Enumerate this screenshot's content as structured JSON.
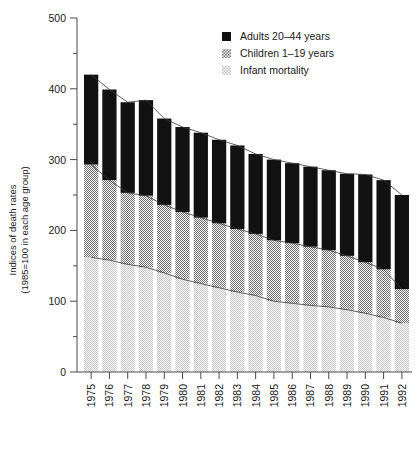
{
  "chart_data": {
    "type": "bar",
    "title": "",
    "subtitle": "",
    "stacked": true,
    "xlabel": "",
    "ylabel": "Indices of death rates",
    "ylabel_line2": "(1985=100 in each age group)",
    "ylim": [
      0,
      500
    ],
    "yticks": [
      0,
      100,
      200,
      300,
      400,
      500
    ],
    "ytick_labels": [
      "0",
      "100",
      "200",
      "300",
      "400",
      "500"
    ],
    "yminor_step": 50,
    "grid": false,
    "legend_position": "top-right",
    "categories": [
      "1975",
      "1976",
      "1977",
      "1978",
      "1979",
      "1980",
      "1981",
      "1982",
      "1983",
      "1984",
      "1985",
      "1986",
      "1987",
      "1988",
      "1989",
      "1990",
      "1991",
      "1992"
    ],
    "series": [
      {
        "name": "Infant mortality",
        "key": "infant",
        "fill": "#d0d0d0",
        "pattern": "fine-checker-light",
        "values": [
          162,
          158,
          152,
          148,
          140,
          131,
          125,
          119,
          113,
          108,
          100,
          97,
          94,
          92,
          88,
          83,
          77,
          69
        ]
      },
      {
        "name": "Children 1–19 years",
        "key": "children",
        "fill": "#8c8c8c",
        "pattern": "checker-mid",
        "values": [
          131,
          113,
          101,
          101,
          96,
          95,
          93,
          91,
          89,
          87,
          86,
          85,
          83,
          80,
          76,
          72,
          68,
          48
        ]
      },
      {
        "name": "Adults 20–44 years",
        "key": "adults",
        "fill": "#111111",
        "pattern": "solid",
        "values": [
          127,
          128,
          128,
          135,
          122,
          120,
          120,
          118,
          118,
          113,
          114,
          113,
          113,
          113,
          116,
          124,
          126,
          133
        ]
      }
    ],
    "totals": [
      420,
      399,
      381,
      384,
      358,
      346,
      338,
      328,
      320,
      308,
      300,
      295,
      290,
      285,
      280,
      279,
      271,
      250
    ],
    "cumulative": {
      "infant_top": [
        162,
        158,
        152,
        148,
        140,
        131,
        125,
        119,
        113,
        108,
        100,
        97,
        94,
        92,
        88,
        83,
        77,
        69
      ],
      "children_top": [
        293,
        271,
        253,
        249,
        236,
        226,
        218,
        210,
        202,
        195,
        186,
        182,
        177,
        172,
        164,
        155,
        145,
        117
      ],
      "adults_top": [
        420,
        399,
        381,
        384,
        358,
        346,
        338,
        328,
        320,
        308,
        300,
        295,
        290,
        285,
        280,
        279,
        271,
        250
      ]
    },
    "trend_lines": [
      {
        "name": "total-trend",
        "follows": "adults_top"
      },
      {
        "name": "children-trend",
        "follows": "children_top"
      },
      {
        "name": "infant-trend",
        "follows": "infant_top"
      }
    ],
    "legend": [
      {
        "label": "Adults 20–44 years",
        "swatch": "solid-black"
      },
      {
        "label": "Children 1–19 years",
        "swatch": "checker-mid"
      },
      {
        "label": "Infant mortality",
        "swatch": "checker-light"
      }
    ]
  },
  "colors": {
    "adults": "#111111",
    "children": "#8c8c8c",
    "infant": "#d0d0d0",
    "axis": "#4a4a4a",
    "text": "#1a1a1a",
    "background": "#ffffff"
  }
}
